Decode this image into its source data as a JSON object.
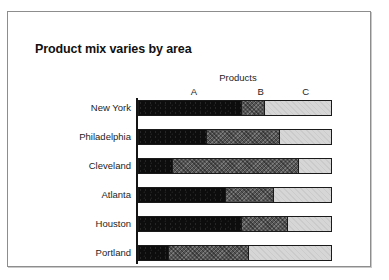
{
  "figure": {
    "title": "Product mix varies by area",
    "legend_caption": "Products"
  },
  "chart_data": {
    "type": "bar",
    "orientation": "horizontal",
    "stacked": true,
    "normalized_percent": true,
    "title": "Product mix varies by area",
    "xlabel": "",
    "ylabel": "",
    "xlim": [
      0,
      100
    ],
    "grid": false,
    "legend_position": "top",
    "legend_caption": "Products",
    "categories": [
      "New York",
      "Philadelphia",
      "Cleveland",
      "Atlanta",
      "Houston",
      "Portland"
    ],
    "series": [
      {
        "name": "A",
        "values": [
          53,
          35,
          17,
          45,
          53,
          15
        ]
      },
      {
        "name": "B",
        "values": [
          12,
          38,
          66,
          25,
          24,
          42
        ]
      },
      {
        "name": "C",
        "values": [
          35,
          27,
          17,
          30,
          23,
          43
        ]
      }
    ],
    "series_colors": [
      "#0d0d0d",
      "#555555",
      "#d6d6d6"
    ],
    "tick_labels": [
      "A",
      "B",
      "C"
    ]
  },
  "axis": {
    "rows": [
      {
        "label": "New York",
        "a": 53,
        "b": 12,
        "c": 35
      },
      {
        "label": "Philadelphia",
        "a": 35,
        "b": 38,
        "c": 27
      },
      {
        "label": "Cleveland",
        "a": 17,
        "b": 66,
        "c": 17
      },
      {
        "label": "Atlanta",
        "a": 45,
        "b": 25,
        "c": 30
      },
      {
        "label": "Houston",
        "a": 53,
        "b": 24,
        "c": 23
      },
      {
        "label": "Portland",
        "a": 15,
        "b": 42,
        "c": 43
      }
    ]
  },
  "letters": [
    {
      "text": "A",
      "left_pct": 26
    },
    {
      "text": "B",
      "left_pct": 60
    },
    {
      "text": "C",
      "left_pct": 83
    }
  ]
}
